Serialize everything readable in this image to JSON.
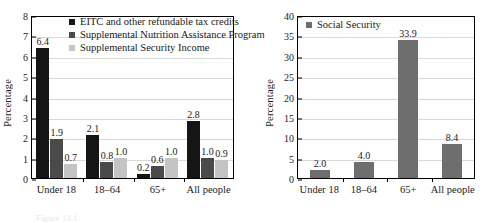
{
  "chart_data": [
    {
      "id": "left",
      "type": "bar",
      "title": "",
      "xlabel": "",
      "ylabel": "Percentage",
      "ylim": [
        0,
        8
      ],
      "ystep": 1,
      "yticks": [
        "0",
        "1",
        "2",
        "3",
        "4",
        "5",
        "6",
        "7",
        "8"
      ],
      "grid": true,
      "legend_position": "top-center",
      "categories": [
        "Under 18",
        "18–64",
        "65+",
        "All people"
      ],
      "series": [
        {
          "name": "EITC and other refundable tax credits",
          "color": "#151515",
          "values": [
            6.4,
            2.1,
            0.2,
            2.8
          ],
          "labels": [
            "6.4",
            "2.1",
            "0.2",
            "2.8"
          ]
        },
        {
          "name": "Supplemental Nutrition Assistance Program",
          "color": "#4a4a4a",
          "values": [
            1.9,
            0.8,
            0.6,
            1.0
          ],
          "labels": [
            "1.9",
            "0.8",
            "0.6",
            "1.0"
          ]
        },
        {
          "name": "Supplemental Security Income",
          "color": "#c4c4c4",
          "values": [
            0.7,
            1.0,
            1.0,
            0.9
          ],
          "labels": [
            "0.7",
            "1.0",
            "1.0",
            "0.9"
          ]
        }
      ]
    },
    {
      "id": "right",
      "type": "bar",
      "title": "",
      "xlabel": "",
      "ylabel": "Percentage",
      "ylim": [
        0,
        40
      ],
      "ystep": 5,
      "yticks": [
        "0",
        "5",
        "10",
        "15",
        "20",
        "25",
        "30",
        "35",
        "40"
      ],
      "grid": true,
      "legend_position": "top-left",
      "categories": [
        "Under 18",
        "18–64",
        "65+",
        "All people"
      ],
      "series": [
        {
          "name": "Social Security",
          "color": "#6e6e6e",
          "values": [
            2.0,
            4.0,
            33.9,
            8.4
          ],
          "labels": [
            "2.0",
            "4.0",
            "33.9",
            "8.4"
          ]
        }
      ]
    }
  ],
  "caption": {
    "text": "Figure 13.1"
  }
}
